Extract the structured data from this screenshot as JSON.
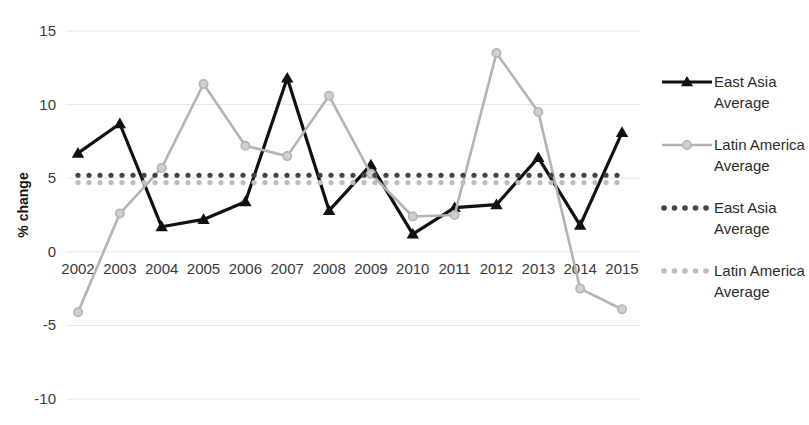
{
  "chart_data": {
    "type": "line",
    "title": "",
    "xlabel": "",
    "ylabel": "% change",
    "categories": [
      "2002",
      "2003",
      "2004",
      "2005",
      "2006",
      "2007",
      "2008",
      "2009",
      "2010",
      "2011",
      "2012",
      "2013",
      "2014",
      "2015"
    ],
    "ylim": [
      -10,
      15
    ],
    "ytick_labels": [
      "15",
      "10",
      "5",
      "0",
      "-5",
      "-10"
    ],
    "ytick_values": [
      15,
      10,
      5,
      0,
      -5,
      -10
    ],
    "grid": true,
    "legend_position": "right",
    "series": [
      {
        "name": "East Asia",
        "legend_label_line1": "East Asia",
        "legend_label_line2": "Average",
        "style": "solid",
        "marker": "triangle",
        "color": "#111111",
        "values": [
          6.7,
          8.7,
          1.7,
          2.2,
          3.4,
          11.8,
          2.8,
          5.9,
          1.2,
          3.0,
          3.2,
          6.4,
          1.8,
          8.1
        ]
      },
      {
        "name": "Latin America",
        "legend_label_line1": "Latin America",
        "legend_label_line2": "Average",
        "style": "solid",
        "marker": "circle",
        "color": "#b3b3b3",
        "values": [
          -4.1,
          2.6,
          5.7,
          11.4,
          7.2,
          6.5,
          10.6,
          5.3,
          2.4,
          2.5,
          13.5,
          9.5,
          -2.5,
          -3.9
        ]
      },
      {
        "name": "East Asia Average",
        "legend_label_line1": "East Asia",
        "legend_label_line2": "Average",
        "style": "dotted",
        "marker": "none",
        "color": "#444444",
        "constant_value": 5.2,
        "values": [
          5.2,
          5.2,
          5.2,
          5.2,
          5.2,
          5.2,
          5.2,
          5.2,
          5.2,
          5.2,
          5.2,
          5.2,
          5.2,
          5.2
        ]
      },
      {
        "name": "Latin America Average",
        "legend_label_line1": "Latin America",
        "legend_label_line2": "Average",
        "style": "dotted",
        "marker": "none",
        "color": "#bdbdbd",
        "constant_value": 4.7,
        "values": [
          4.7,
          4.7,
          4.7,
          4.7,
          4.7,
          4.7,
          4.7,
          4.7,
          4.7,
          4.7,
          4.7,
          4.7,
          4.7,
          4.7
        ]
      }
    ]
  },
  "legend": {
    "entries": [
      {
        "line1": "East Asia",
        "line2": "Average",
        "swatch": "solid-black-triangle"
      },
      {
        "line1": "Latin America",
        "line2": "Average",
        "swatch": "solid-gray-circle"
      },
      {
        "line1": "East Asia",
        "line2": "Average",
        "swatch": "dotted-black"
      },
      {
        "line1": "Latin America",
        "line2": "Average",
        "swatch": "dotted-gray"
      }
    ]
  },
  "axis": {
    "y_title": "% change",
    "y_ticks": [
      "15",
      "10",
      "5",
      "0",
      "-5",
      "-10"
    ],
    "x_ticks": [
      "2002",
      "2003",
      "2004",
      "2005",
      "2006",
      "2007",
      "2008",
      "2009",
      "2010",
      "2011",
      "2012",
      "2013",
      "2014",
      "2015"
    ]
  },
  "colors": {
    "east_asia": "#111111",
    "latin_america": "#b3b3b3",
    "east_asia_avg": "#444444",
    "latin_america_avg": "#bdbdbd",
    "grid": "#e6e6e6",
    "text": "#3a3a3a",
    "background": "#ffffff"
  }
}
